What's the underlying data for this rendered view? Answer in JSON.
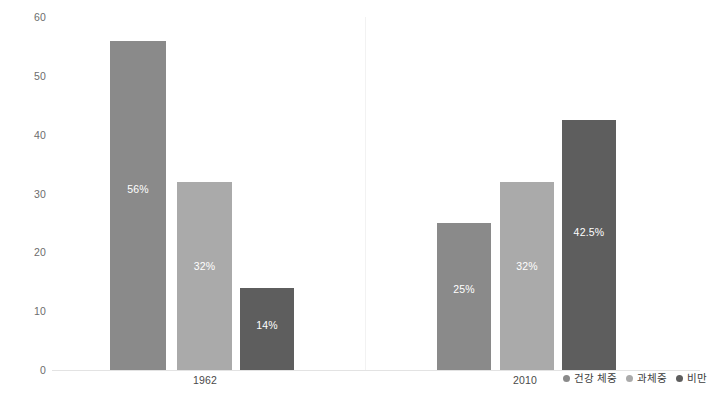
{
  "chart_data": {
    "type": "bar",
    "title": "",
    "subtitle": "",
    "xlabel": "",
    "ylabel": "",
    "ylim": [
      0,
      60
    ],
    "y_ticks": [
      "0",
      "10",
      "20",
      "30",
      "40",
      "50",
      "60"
    ],
    "grid": false,
    "legend_position": "bottom-right",
    "categories": [
      "1962",
      "2010"
    ],
    "series": [
      {
        "name": "건강 체중",
        "color": "#8a8a8a",
        "values": [
          56,
          25
        ],
        "labels": [
          "56%",
          "25%"
        ]
      },
      {
        "name": "과체중",
        "color": "#aaaaaa",
        "values": [
          32,
          32
        ],
        "labels": [
          "32%",
          "32%"
        ]
      },
      {
        "name": "비만",
        "color": "#5e5e5e",
        "values": [
          14,
          42.5
        ],
        "labels": [
          "14%",
          "42.5%"
        ]
      }
    ]
  },
  "axis": {
    "tick_60": "60",
    "tick_50": "50",
    "tick_40": "40",
    "tick_30": "30",
    "tick_20": "20",
    "tick_10": "10",
    "tick_0": "0"
  },
  "groups": {
    "g0_label": "1962",
    "g1_label": "2010"
  },
  "bars": {
    "g0_s0_label": "56%",
    "g0_s1_label": "32%",
    "g0_s2_label": "14%",
    "g1_s0_label": "25%",
    "g1_s1_label": "32%",
    "g1_s2_label": "42.5%"
  },
  "legend": {
    "item0": "건강 체중",
    "item1": "과체중",
    "item2": "비만"
  },
  "colors": {
    "healthy": "#8a8a8a",
    "overweight": "#aaaaaa",
    "obese": "#5e5e5e",
    "axis_line": "#e3e3e3",
    "divider": "#f2f2f2",
    "tick_text": "#6d6d6d",
    "background": "#ffffff"
  }
}
